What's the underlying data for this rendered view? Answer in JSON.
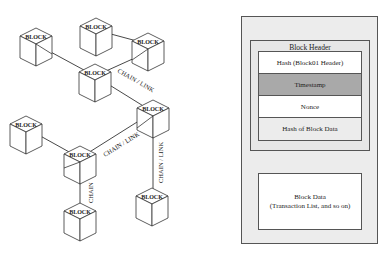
{
  "chain_diagram": {
    "block_label": "BLOCK",
    "link_labels": {
      "chain_link_1": "CHAIN / LINK",
      "chain_link_2": "CHAIN / LINK",
      "chain_link_3": "CHAIN / LINK",
      "chain": "CHAIN"
    },
    "blocks": [
      {
        "id": "A",
        "label": "BLOCK"
      },
      {
        "id": "B",
        "label": "BLOCK"
      },
      {
        "id": "C",
        "label": "BLOCK"
      },
      {
        "id": "D",
        "label": "BLOCK"
      },
      {
        "id": "E",
        "label": "BLOCK"
      },
      {
        "id": "F",
        "label": "BLOCK"
      },
      {
        "id": "G",
        "label": "BLOCK"
      },
      {
        "id": "H",
        "label": "BLOCK"
      },
      {
        "id": "I",
        "label": "BLOCK"
      }
    ]
  },
  "block_structure": {
    "header_title": "Block Header",
    "fields": [
      {
        "label": "Hash (Block01 Header)",
        "color": "#ffffff"
      },
      {
        "label": "Timestamp",
        "color": "#a9a9a9"
      },
      {
        "label": "Nonce",
        "color": "#ffffff"
      },
      {
        "label": "Hash of Block Data",
        "color": "#ececec"
      }
    ],
    "data_title": "Block Data",
    "data_subtitle": "(Transaction List, and so on)"
  }
}
